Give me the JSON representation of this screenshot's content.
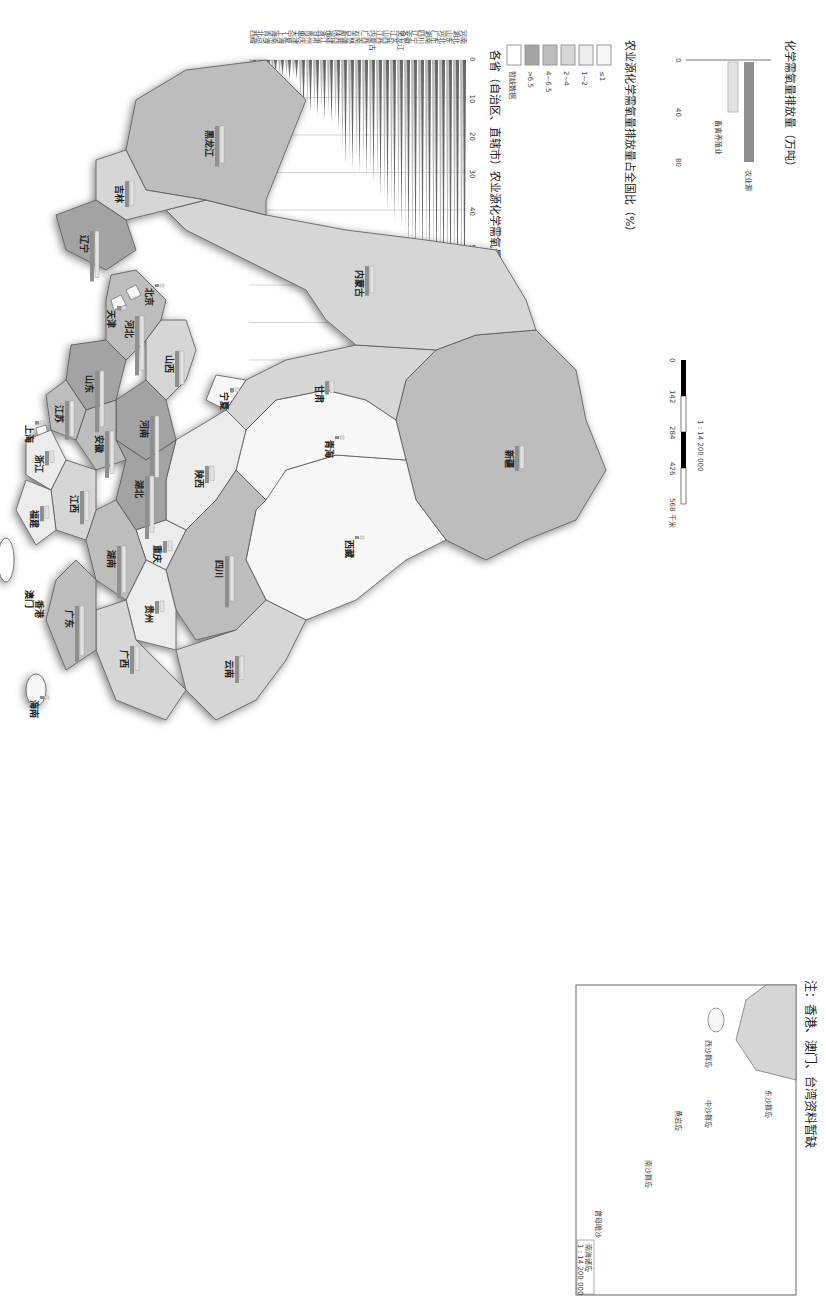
{
  "map": {
    "title_scale": "1 : 14 200 000",
    "scale_ticks": [
      "0",
      "142",
      "284",
      "426",
      "568 千米"
    ],
    "note": "注：香港、澳门、台湾资料暂缺",
    "inset_label": "南海诸岛",
    "inset_scale": "1 : 14 200 000",
    "islands": [
      "钓鱼岛",
      "赤尾屿",
      "东沙群岛",
      "西沙群岛",
      "中沙群岛",
      "黄岩岛",
      "南沙群岛",
      "曾母暗沙"
    ],
    "provinces": [
      {
        "name": "新疆",
        "class": "4~6.5"
      },
      {
        "name": "西藏",
        "class": "≤1"
      },
      {
        "name": "青海",
        "class": "≤1"
      },
      {
        "name": "甘肃",
        "class": "2~4"
      },
      {
        "name": "内蒙古",
        "class": "2~4"
      },
      {
        "name": "宁夏",
        "class": "≤1"
      },
      {
        "name": "四川",
        "class": "4~6.5"
      },
      {
        "name": "云南",
        "class": "2~4"
      },
      {
        "name": "陕西",
        "class": "1~2"
      },
      {
        "name": "山西",
        "class": "2~4"
      },
      {
        "name": "河南",
        "class": ">6.5"
      },
      {
        "name": "河北",
        "class": "4~6.5"
      },
      {
        "name": "北京",
        "class": "≤1"
      },
      {
        "name": "天津",
        "class": "≤1"
      },
      {
        "name": "山东",
        "class": ">6.5"
      },
      {
        "name": "辽宁",
        "class": ">6.5"
      },
      {
        "name": "吉林",
        "class": "2~4"
      },
      {
        "name": "黑龙江",
        "class": "4~6.5"
      },
      {
        "name": "重庆",
        "class": "1~2"
      },
      {
        "name": "贵州",
        "class": "1~2"
      },
      {
        "name": "湖北",
        "class": ">6.5"
      },
      {
        "name": "湖南",
        "class": "4~6.5"
      },
      {
        "name": "广西",
        "class": "2~4"
      },
      {
        "name": "广东",
        "class": "4~6.5"
      },
      {
        "name": "江西",
        "class": "2~4"
      },
      {
        "name": "安徽",
        "class": "4~6.5"
      },
      {
        "name": "江苏",
        "class": "4~6.5"
      },
      {
        "name": "上海",
        "class": "≤1"
      },
      {
        "name": "浙江",
        "class": "1~2"
      },
      {
        "name": "福建",
        "class": "1~2"
      },
      {
        "name": "海南",
        "class": "≤1"
      },
      {
        "name": "台湾",
        "class": "暂缺数据"
      },
      {
        "name": "香港",
        "class": "暂缺数据"
      },
      {
        "name": "澳门",
        "class": "暂缺数据"
      }
    ]
  },
  "legend": {
    "title": "农业源化学需氧量排放量占全国比（%）",
    "classes": [
      {
        "label": "≤1",
        "color": "#f7f7f7"
      },
      {
        "label": "1~2",
        "color": "#ececec"
      },
      {
        "label": "2~4",
        "color": "#d6d6d6"
      },
      {
        "label": "4~6.5",
        "color": "#bdbdbd"
      },
      {
        "label": ">6.5",
        "color": "#a3a3a3"
      },
      {
        "label": "暂缺数据",
        "color": "#ffffff"
      }
    ]
  },
  "bar_legend": {
    "title": "化学需氧量排放量（万吨）",
    "series": [
      {
        "name": "农业源",
        "color": "#8f8f8f",
        "value": 80
      },
      {
        "name": "畜禽养殖业",
        "color": "#e3e3e3",
        "value": 40
      }
    ],
    "ticks": [
      "0",
      "40",
      "80"
    ]
  },
  "chart_data": {
    "type": "bar",
    "title": "各省（自治区、直辖市）农业源化学需氧量排放量（万吨）",
    "xlabel": "",
    "ylabel": "万吨",
    "ylim": [
      0,
      80
    ],
    "ticks": [
      0,
      10,
      20,
      30,
      40,
      50,
      60,
      70,
      80
    ],
    "legend": [
      "农业源",
      "畜禽养殖业"
    ],
    "grid": true,
    "categories": [
      "河南",
      "湖北",
      "山东",
      "河北",
      "广东",
      "湖南",
      "四川",
      "辽宁",
      "安徽",
      "黑龙江",
      "江苏",
      "山西",
      "江西",
      "内蒙古",
      "广西",
      "云南",
      "吉林",
      "新疆",
      "陕西",
      "福建",
      "浙江",
      "甘肃",
      "贵州",
      "重庆",
      "天津",
      "宁夏",
      "上海",
      "海南",
      "青海",
      "北京",
      "西藏"
    ],
    "series": [
      {
        "name": "农业源",
        "values": [
          75,
          70,
          68,
          66,
          62,
          58,
          57,
          56,
          52,
          45,
          43,
          40,
          37,
          33,
          31,
          30,
          29,
          28,
          19,
          17,
          16,
          15,
          14,
          13,
          5,
          5,
          4,
          3,
          2,
          2,
          1
        ]
      },
      {
        "name": "畜禽养殖业",
        "values": [
          68,
          63,
          62,
          60,
          55,
          52,
          50,
          52,
          47,
          41,
          39,
          37,
          33,
          30,
          27,
          26,
          27,
          25,
          16,
          14,
          13,
          13,
          12,
          11,
          4,
          4,
          3,
          2,
          2,
          1,
          1
        ]
      }
    ]
  }
}
